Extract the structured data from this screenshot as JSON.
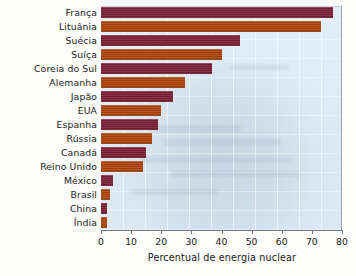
{
  "chart_data": {
    "type": "bar",
    "orientation": "horizontal",
    "title": "",
    "subtitle": "",
    "xlabel": "Percentual de energia nuclear",
    "ylabel": "",
    "xlim": [
      0,
      80
    ],
    "xticks": [
      0,
      10,
      20,
      30,
      40,
      50,
      60,
      70,
      80
    ],
    "xtick_labels": [
      "0",
      "10",
      "20",
      "30",
      "40",
      "50",
      "60",
      "70",
      "80"
    ],
    "grid": false,
    "legend": null,
    "categories": [
      "França",
      "Lituânia",
      "Suécia",
      "Suíça",
      "Coreia do Sul",
      "Alemanha",
      "Japão",
      "EUA",
      "Espanha",
      "Rússia",
      "Canadá",
      "Reino Unido",
      "México",
      "Brasil",
      "China",
      "Índia"
    ],
    "values": [
      77,
      73,
      46,
      40,
      37,
      28,
      24,
      20,
      19,
      17,
      15,
      14,
      4,
      3,
      2,
      2
    ],
    "bars": [
      {
        "label": "França",
        "value": 77,
        "color": "#7a1d33"
      },
      {
        "label": "Lituânia",
        "value": 73,
        "color": "#ab4209"
      },
      {
        "label": "Suécia",
        "value": 46,
        "color": "#7a1d33"
      },
      {
        "label": "Suíça",
        "value": 40,
        "color": "#ab4209"
      },
      {
        "label": "Coreia do Sul",
        "value": 37,
        "color": "#7a1d33"
      },
      {
        "label": "Alemanha",
        "value": 28,
        "color": "#ab4209"
      },
      {
        "label": "Japão",
        "value": 24,
        "color": "#7a1d33"
      },
      {
        "label": "EUA",
        "value": 20,
        "color": "#ab4209"
      },
      {
        "label": "Espanha",
        "value": 19,
        "color": "#7a1d33"
      },
      {
        "label": "Rússia",
        "value": 17,
        "color": "#ab4209"
      },
      {
        "label": "Canadá",
        "value": 15,
        "color": "#7a1d33"
      },
      {
        "label": "Reino Unido",
        "value": 14,
        "color": "#ab4209"
      },
      {
        "label": "México",
        "value": 4,
        "color": "#7a1d33"
      },
      {
        "label": "Brasil",
        "value": 3,
        "color": "#ab4209"
      },
      {
        "label": "China",
        "value": 2,
        "color": "#7a1d33"
      },
      {
        "label": "Índia",
        "value": 2,
        "color": "#ab4209"
      }
    ],
    "colors": {
      "bar_maroon": "#7a1d33",
      "bar_rust": "#ab4209",
      "plot_background": "#e2eef7",
      "axis_line": "#6e7b87",
      "text": "#1b1b1b"
    }
  }
}
